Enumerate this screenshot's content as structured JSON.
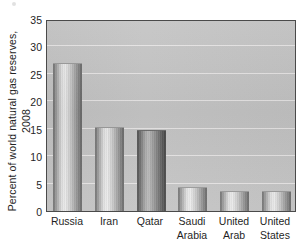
{
  "chart_data": {
    "type": "bar",
    "title": "",
    "subtitle": "",
    "xlabel": "",
    "ylabel": "Percent of world natural gas reserves, 2008",
    "ylabel_lines": [
      "Percent of world natural gas reserves,",
      "2008"
    ],
    "categories": [
      "Russia",
      "Iran",
      "Qatar",
      "Saudi Arabia",
      "United Arab",
      "United States"
    ],
    "category_lines": [
      [
        "Russia"
      ],
      [
        "Iran"
      ],
      [
        "Qatar"
      ],
      [
        "Saudi",
        "Arabia"
      ],
      [
        "United",
        "Arab"
      ],
      [
        "United",
        "States"
      ]
    ],
    "values": [
      27.0,
      15.3,
      14.7,
      4.3,
      3.6,
      3.6
    ],
    "ylim": [
      0,
      35
    ],
    "yticks": [
      0,
      5,
      10,
      15,
      20,
      25,
      30,
      35
    ],
    "ytick_labels": [
      "0",
      "5",
      "10",
      "15",
      "20",
      "25",
      "30",
      "35"
    ],
    "grid": true,
    "grid_axis": "y",
    "grid_color": "#eceaea",
    "legend": false,
    "legend_position": "none",
    "plot_background": "#c4c4c4",
    "plot_border_color": "#4a4a4a",
    "bar_fill_light": "#e2e2e2",
    "bar_fill_dark": "#6f6f6f",
    "bar_styles": [
      "light",
      "light",
      "dark",
      "light",
      "light",
      "light"
    ],
    "text_color": "#1f1f1f",
    "page_background": "#ffffff"
  }
}
